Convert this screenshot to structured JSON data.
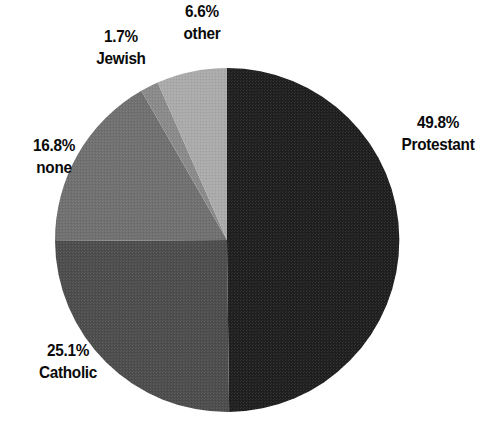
{
  "chart_data": {
    "type": "pie",
    "title": "",
    "subtitle": "",
    "xlabel": "",
    "ylabel": "",
    "legend_position": "none",
    "grid": false,
    "units": "percent",
    "start_angle_deg": 0,
    "direction": "clockwise",
    "categories": [
      "Protestant",
      "Catholic",
      "none",
      "Jewish",
      "other"
    ],
    "values": [
      49.8,
      25.1,
      16.8,
      1.7,
      6.6
    ],
    "slices": [
      {
        "label": "Protestant",
        "value": 49.8,
        "value_text": "49.8%",
        "color": "#1f1f1f",
        "label_position": "right"
      },
      {
        "label": "Catholic",
        "value": 25.1,
        "value_text": "25.1%",
        "color": "#4d4d4d",
        "label_position": "bottom-left"
      },
      {
        "label": "none",
        "value": 16.8,
        "value_text": "16.8%",
        "color": "#707070",
        "label_position": "left"
      },
      {
        "label": "Jewish",
        "value": 1.7,
        "value_text": "1.7%",
        "color": "#8a8a8a",
        "label_position": "top-left"
      },
      {
        "label": "other",
        "value": 6.6,
        "value_text": "6.6%",
        "color": "#aaaaaa",
        "label_position": "top"
      }
    ]
  },
  "labels": {
    "protestant": {
      "pct": "49.8%",
      "name": "Protestant"
    },
    "catholic": {
      "pct": "25.1%",
      "name": "Catholic"
    },
    "none": {
      "pct": "16.8%",
      "name": "none"
    },
    "jewish": {
      "pct": "1.7%",
      "name": "Jewish"
    },
    "other": {
      "pct": "6.6%",
      "name": "other"
    }
  },
  "colors": {
    "background": "#ffffff",
    "text": "#0a0a0a",
    "protestant": "#1f1f1f",
    "catholic": "#4d4d4d",
    "none": "#707070",
    "jewish": "#8a8a8a",
    "other": "#aaaaaa"
  },
  "geometry": {
    "center_x": 227,
    "center_y": 240,
    "radius": 172
  }
}
